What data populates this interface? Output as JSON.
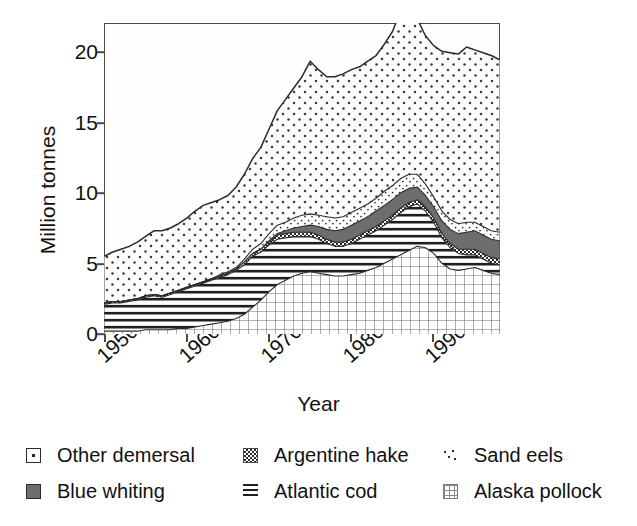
{
  "axes": {
    "ylabel": "Million tonnes",
    "xlabel": "Year",
    "yticks": [
      "0",
      "5",
      "10",
      "15",
      "20"
    ],
    "xticks": [
      "1950",
      "1960",
      "1970",
      "1980",
      "1990"
    ]
  },
  "legend": {
    "items": [
      {
        "label": "Other demersal",
        "pattern": "sparse-dots-open",
        "swatch": "open-dot"
      },
      {
        "label": "Blue whiting",
        "pattern": "solid-dark",
        "swatch": "solid"
      },
      {
        "label": "Argentine hake",
        "pattern": "checker",
        "swatch": "checker"
      },
      {
        "label": "Atlantic cod",
        "pattern": "horizontal-lines",
        "swatch": "hlines"
      },
      {
        "label": "Sand eels",
        "pattern": "tiny-dots",
        "swatch": "tiny-dots"
      },
      {
        "label": "Alaska pollock",
        "pattern": "grid",
        "swatch": "grid"
      }
    ]
  },
  "colors": {
    "axis": "#4a4a4a",
    "text": "#111111",
    "outline": "#2b2b2b",
    "blue_whiting_fill": "#6d6d6d",
    "plot_background": "#fefefe"
  },
  "chart_data": {
    "type": "area",
    "title": "",
    "subtitle": "",
    "xlabel": "Year",
    "ylabel": "Million tonnes",
    "xlim": [
      1950,
      1998
    ],
    "ylim": [
      0,
      22
    ],
    "yticks": [
      0,
      5,
      10,
      15,
      20
    ],
    "xticks": [
      1950,
      1960,
      1970,
      1980,
      1990
    ],
    "grid": false,
    "legend_position": "below",
    "stacked": true,
    "stack_order_bottom_to_top": [
      "Alaska pollock",
      "Atlantic cod",
      "Argentine hake",
      "Blue whiting",
      "Sand eels",
      "Other demersal"
    ],
    "x": [
      1950,
      1951,
      1952,
      1953,
      1954,
      1955,
      1956,
      1957,
      1958,
      1959,
      1960,
      1961,
      1962,
      1963,
      1964,
      1965,
      1966,
      1967,
      1968,
      1969,
      1970,
      1971,
      1972,
      1973,
      1974,
      1975,
      1976,
      1977,
      1978,
      1979,
      1980,
      1981,
      1982,
      1983,
      1984,
      1985,
      1986,
      1987,
      1988,
      1989,
      1990,
      1991,
      1992,
      1993,
      1994,
      1995,
      1996,
      1997,
      1998
    ],
    "series": [
      {
        "name": "Alaska pollock",
        "values": [
          0.2,
          0.2,
          0.2,
          0.2,
          0.2,
          0.3,
          0.3,
          0.3,
          0.3,
          0.4,
          0.4,
          0.5,
          0.6,
          0.7,
          0.8,
          0.9,
          1.1,
          1.4,
          1.9,
          2.4,
          3.0,
          3.5,
          3.8,
          4.1,
          4.3,
          4.4,
          4.3,
          4.2,
          4.1,
          4.1,
          4.2,
          4.3,
          4.5,
          4.7,
          5.0,
          5.3,
          5.6,
          5.9,
          6.2,
          6.1,
          5.7,
          5.0,
          4.6,
          4.5,
          4.6,
          4.7,
          4.5,
          4.3,
          4.2
        ]
      },
      {
        "name": "Atlantic cod",
        "values": [
          1.9,
          2.0,
          2.0,
          2.1,
          2.2,
          2.3,
          2.4,
          2.3,
          2.5,
          2.6,
          2.8,
          2.9,
          3.0,
          3.1,
          3.2,
          3.3,
          3.4,
          3.5,
          3.6,
          3.4,
          3.3,
          3.2,
          3.0,
          2.8,
          2.6,
          2.5,
          2.4,
          2.2,
          2.1,
          2.1,
          2.2,
          2.4,
          2.5,
          2.6,
          2.7,
          2.8,
          3.0,
          3.1,
          3.0,
          2.6,
          2.2,
          1.8,
          1.5,
          1.2,
          1.0,
          0.9,
          0.8,
          0.7,
          0.7
        ]
      },
      {
        "name": "Argentine hake",
        "values": [
          0.1,
          0.1,
          0.1,
          0.1,
          0.1,
          0.1,
          0.1,
          0.1,
          0.1,
          0.1,
          0.1,
          0.1,
          0.1,
          0.1,
          0.1,
          0.1,
          0.1,
          0.2,
          0.2,
          0.2,
          0.2,
          0.3,
          0.3,
          0.3,
          0.3,
          0.3,
          0.3,
          0.3,
          0.3,
          0.3,
          0.3,
          0.3,
          0.3,
          0.3,
          0.3,
          0.3,
          0.3,
          0.3,
          0.3,
          0.3,
          0.3,
          0.3,
          0.3,
          0.3,
          0.4,
          0.4,
          0.4,
          0.4,
          0.4
        ]
      },
      {
        "name": "Blue whiting",
        "values": [
          0.0,
          0.0,
          0.0,
          0.0,
          0.0,
          0.0,
          0.0,
          0.0,
          0.0,
          0.0,
          0.0,
          0.0,
          0.0,
          0.0,
          0.0,
          0.0,
          0.0,
          0.0,
          0.0,
          0.0,
          0.1,
          0.1,
          0.2,
          0.3,
          0.4,
          0.5,
          0.6,
          0.7,
          0.8,
          0.9,
          1.0,
          1.0,
          1.0,
          1.1,
          1.1,
          1.1,
          1.1,
          1.0,
          0.9,
          0.8,
          0.8,
          0.9,
          1.0,
          1.1,
          1.2,
          1.3,
          1.3,
          1.3,
          1.3
        ]
      },
      {
        "name": "Sand eels",
        "values": [
          0.0,
          0.0,
          0.0,
          0.0,
          0.0,
          0.0,
          0.0,
          0.0,
          0.0,
          0.0,
          0.0,
          0.0,
          0.0,
          0.0,
          0.1,
          0.1,
          0.1,
          0.2,
          0.3,
          0.4,
          0.5,
          0.6,
          0.6,
          0.7,
          0.8,
          0.8,
          0.8,
          0.9,
          0.9,
          0.9,
          0.9,
          0.9,
          0.9,
          0.9,
          1.0,
          1.0,
          1.0,
          1.0,
          0.9,
          0.8,
          0.7,
          0.7,
          0.7,
          0.7,
          0.7,
          0.6,
          0.6,
          0.6,
          0.6
        ]
      },
      {
        "name": "Other demersal",
        "values": [
          3.3,
          3.5,
          3.7,
          3.8,
          4.0,
          4.2,
          4.5,
          4.6,
          4.6,
          4.7,
          4.9,
          5.2,
          5.4,
          5.4,
          5.3,
          5.4,
          5.7,
          6.0,
          6.4,
          6.8,
          7.4,
          8.1,
          8.7,
          9.2,
          9.8,
          10.8,
          10.3,
          9.9,
          10.0,
          10.1,
          10.1,
          10.0,
          10.1,
          10.1,
          10.4,
          10.9,
          11.9,
          12.2,
          11.0,
          10.5,
          10.7,
          11.3,
          11.8,
          12.0,
          12.4,
          12.2,
          12.3,
          12.4,
          12.2
        ]
      }
    ],
    "totals": [
      5.5,
      5.8,
      6.0,
      6.2,
      6.5,
      6.9,
      7.3,
      7.3,
      7.5,
      7.8,
      8.2,
      8.7,
      9.1,
      9.3,
      9.5,
      9.8,
      10.4,
      11.3,
      12.4,
      13.2,
      14.5,
      15.8,
      16.6,
      17.4,
      18.2,
      19.3,
      18.7,
      18.2,
      18.2,
      18.4,
      18.7,
      18.9,
      19.3,
      19.7,
      20.5,
      21.4,
      22.9,
      23.5,
      22.3,
      21.1,
      20.4,
      20.0,
      19.9,
      19.8,
      20.3,
      20.1,
      19.9,
      19.7,
      19.4
    ]
  }
}
